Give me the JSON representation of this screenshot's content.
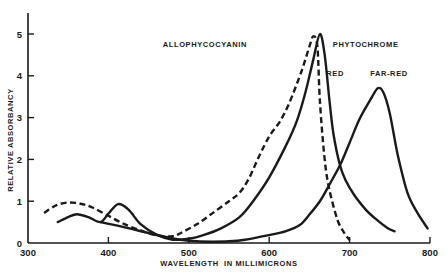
{
  "chart_data": {
    "type": "line",
    "title": "",
    "xlabel": "WAVELENGTH  IN MILLIMICRONS",
    "ylabel": "RELATIVE  ABSORBANCY",
    "xlim": [
      300,
      800
    ],
    "ylim": [
      0,
      5
    ],
    "grid": false,
    "x_ticks": [
      300,
      400,
      500,
      600,
      700,
      800
    ],
    "x_tick_labels": [
      "300",
      "400",
      "500",
      "600",
      "700",
      "800"
    ],
    "y_ticks": [
      0,
      1,
      2,
      3,
      4,
      5
    ],
    "y_tick_labels": [
      "0",
      "1",
      "2",
      "3",
      "4",
      "5"
    ],
    "annotations": [
      {
        "text": "ALLOPHYCOCYANIN",
        "x": 520,
        "y": 4.7
      },
      {
        "text": "PHYTOCHROME",
        "x": 720,
        "y": 4.7
      },
      {
        "text": "RED",
        "x": 682,
        "y": 4.0
      },
      {
        "text": "FAR-RED",
        "x": 749,
        "y": 4.0
      }
    ],
    "series": [
      {
        "name": "Allophycocyanin",
        "style": "dashed",
        "x": [
          320,
          335,
          350,
          365,
          380,
          400,
          420,
          440,
          460,
          480,
          490,
          510,
          530,
          550,
          563,
          575,
          588,
          600,
          613,
          625,
          640,
          650,
          655,
          660,
          663,
          669,
          675,
          685,
          693,
          700
        ],
        "y": [
          0.72,
          0.9,
          0.97,
          0.94,
          0.85,
          0.65,
          0.45,
          0.3,
          0.18,
          0.16,
          0.24,
          0.45,
          0.72,
          1.0,
          1.2,
          1.55,
          2.1,
          2.55,
          2.9,
          3.35,
          4.1,
          4.7,
          4.95,
          4.7,
          3.4,
          2.0,
          1.26,
          0.55,
          0.25,
          0.07
        ]
      },
      {
        "name": "Phytochrome (red)",
        "style": "solid",
        "x": [
          337,
          350,
          361,
          375,
          390,
          400,
          412,
          425,
          440,
          460,
          480,
          500,
          520,
          540,
          563,
          580,
          600,
          620,
          634,
          645,
          655,
          663,
          669,
          675,
          680,
          688,
          695,
          706,
          720,
          731,
          747,
          756
        ],
        "y": [
          0.5,
          0.62,
          0.69,
          0.62,
          0.5,
          0.7,
          0.93,
          0.8,
          0.45,
          0.2,
          0.08,
          0.1,
          0.2,
          0.35,
          0.62,
          1.0,
          1.57,
          2.3,
          2.9,
          3.6,
          4.4,
          5.0,
          4.5,
          3.4,
          2.6,
          1.86,
          1.5,
          1.14,
          0.8,
          0.6,
          0.36,
          0.28
        ]
      },
      {
        "name": "Phytochrome (far-red)",
        "style": "solid",
        "x": [
          390,
          410,
          430,
          450,
          470,
          490,
          510,
          530,
          550,
          570,
          600,
          620,
          638,
          650,
          663,
          675,
          688,
          700,
          712,
          725,
          735,
          742,
          750,
          760,
          772,
          785,
          797
        ],
        "y": [
          0.5,
          0.42,
          0.33,
          0.24,
          0.15,
          0.08,
          0.04,
          0.03,
          0.04,
          0.08,
          0.19,
          0.28,
          0.43,
          0.68,
          1.0,
          1.4,
          1.86,
          2.4,
          2.95,
          3.4,
          3.7,
          3.6,
          3.1,
          2.1,
          1.2,
          0.7,
          0.35
        ]
      }
    ]
  },
  "layout": {
    "plot_left": 28,
    "plot_right": 430,
    "plot_top": 34,
    "plot_bottom": 243,
    "axis_top": 13,
    "ink_color": "#1a1a1a"
  }
}
